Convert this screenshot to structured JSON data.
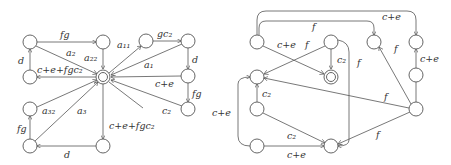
{
  "left_diagram": {
    "nodes": [
      {
        "id": "L1",
        "x": 30,
        "y": 42
      },
      {
        "id": "L2",
        "x": 103,
        "y": 42
      },
      {
        "id": "L3",
        "x": 146,
        "y": 41
      },
      {
        "id": "L4",
        "x": 188,
        "y": 41
      },
      {
        "id": "L5",
        "x": 30,
        "y": 77
      },
      {
        "id": "F",
        "x": 103,
        "y": 77,
        "accepting": true
      },
      {
        "id": "L6",
        "x": 188,
        "y": 76
      },
      {
        "id": "L7",
        "x": 30,
        "y": 109
      },
      {
        "id": "L8",
        "x": 188,
        "y": 109
      },
      {
        "id": "L9",
        "x": 30,
        "y": 146
      },
      {
        "id": "L10",
        "x": 103,
        "y": 146
      }
    ],
    "labels": {
      "fg_top": "fg",
      "a2": "a₂",
      "a22": "a₂₂",
      "a11": "a₁₁",
      "gc2": "gc₂",
      "a1": "a₁",
      "d_left": "d",
      "cefgc2_left": "c+e+fgc₂",
      "d_right": "d",
      "ce_right": "c+e",
      "fg_right": "fg",
      "c2": "c₂",
      "a32": "a₃₂",
      "a3": "a₃",
      "fg_bottom_left": "fg",
      "cefgc2_bottom": "c+e+fgc₂",
      "d_bottom": "d"
    }
  },
  "right_diagram": {
    "labels": {
      "ce_top": "c+e",
      "f_top": "f",
      "ce_cross": "c+e",
      "f_cross": "f",
      "c2_accept": "c₂",
      "f_down": "f",
      "f_upper_right": "f",
      "ce_upper_right": "c+e",
      "c2_left": "c₂",
      "ce_left": "c+e",
      "f_long": "f",
      "c2_diag": "c₂",
      "ce_bottom": "c+e",
      "f_lower": "f"
    }
  }
}
